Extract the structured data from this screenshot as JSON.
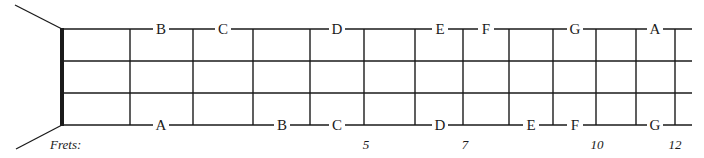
{
  "diagram": {
    "frets_label": "Frets:",
    "colors": {
      "line": "#1a1a1a",
      "background": "#ffffff"
    },
    "nut_x": 62,
    "string_end_x": 692,
    "strings_y": [
      29,
      61,
      93,
      125
    ],
    "fret_x": [
      130,
      193,
      253,
      310,
      364,
      415,
      463,
      509,
      553,
      596,
      636,
      675
    ],
    "fret_numbers": [
      {
        "label": "5",
        "x": 366
      },
      {
        "label": "7",
        "x": 465
      },
      {
        "label": "10",
        "x": 597
      },
      {
        "label": "12",
        "x": 675
      }
    ],
    "top_string_notes": [
      {
        "label": "B",
        "x": 161
      },
      {
        "label": "C",
        "x": 223
      },
      {
        "label": "D",
        "x": 337
      },
      {
        "label": "E",
        "x": 440
      },
      {
        "label": "F",
        "x": 486
      },
      {
        "label": "G",
        "x": 575
      },
      {
        "label": "A",
        "x": 655
      }
    ],
    "bottom_string_notes": [
      {
        "label": "A",
        "x": 161
      },
      {
        "label": "B",
        "x": 282
      },
      {
        "label": "C",
        "x": 337
      },
      {
        "label": "D",
        "x": 440
      },
      {
        "label": "E",
        "x": 531
      },
      {
        "label": "F",
        "x": 575
      },
      {
        "label": "G",
        "x": 655
      }
    ]
  }
}
